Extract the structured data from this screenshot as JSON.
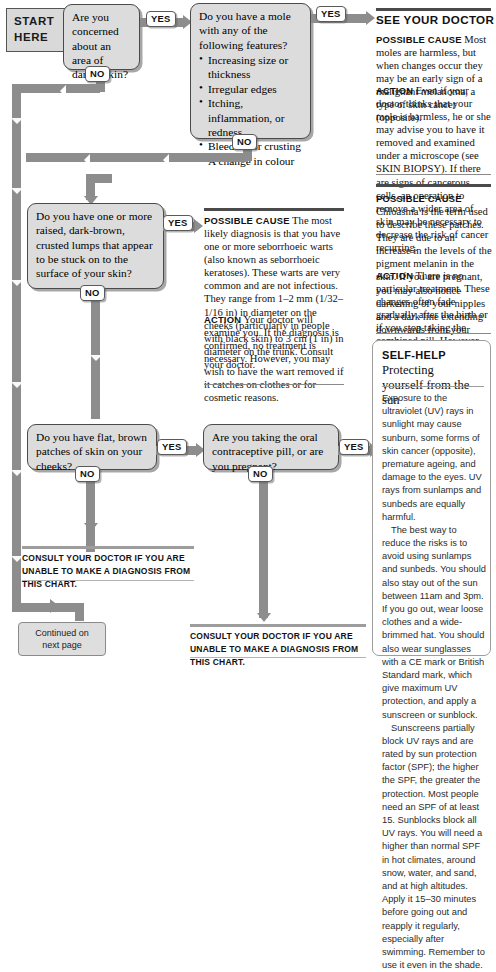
{
  "start_banner": {
    "line1": "START",
    "line2": "HERE"
  },
  "questions": [
    {
      "id": "q1",
      "text": "Are you concerned about an area of darker skin?"
    },
    {
      "id": "q2",
      "lead": "Do you have a mole with any of the following features?",
      "bullets": [
        "Increasing size or thickness",
        "Irregular edges",
        "Itching, inflammation, or redness",
        "Bleeding or crusting",
        "A change in colour"
      ]
    },
    {
      "id": "q3",
      "text": "Do you have one or more raised, dark-brown, crusted lumps that appear to be stuck on to the surface of your skin?"
    },
    {
      "id": "q4",
      "text": "Do you have flat, brown patches of skin on your cheeks?"
    },
    {
      "id": "q5",
      "text": "Are you taking the oral contraceptive pill, or are you pregnant?"
    }
  ],
  "pills": {
    "yes": "YES",
    "no": "NO"
  },
  "advice": [
    {
      "id": "see-your-doctor",
      "heading": "SEE YOUR DOCTOR",
      "possible_label": "POSSIBLE CAUSE",
      "possible_text": "Most moles are harmless, but when changes occur they may be an early sign of a malignant melanoma, a type of skin cancer (opposite).",
      "action_label": "ACTION",
      "action_text": "Even if your doctor thinks that your mole is harmless, he or she may advise you to have it removed and examined under a microscope (see SKIN BIOPSY). If there are signs of cancerous cells, an operation to remove a wider area of skin may be necessary to decrease the risk of cancer recurring."
    },
    {
      "id": "seborrhoeic-warts",
      "possible_label": "POSSIBLE CAUSE",
      "possible_text": "The most likely diagnosis is that you have one or more seborrhoeic warts (also known as seborrhoeic keratoses). These warts are very common and are not infectious. They range from 1–2 mm (1/32–1/16 in) in diameter on the cheeks (particularly in people with black skin) to 3 cm (1 in) in diameter on the trunk. Consult your doctor.",
      "action_label": "ACTION",
      "action_text": "Your doctor will examine you. If the diagnosis is confirmed, no treatment is necessary. However, you may wish to have the wart removed if it catches on clothes or for cosmetic reasons."
    },
    {
      "id": "chloasma",
      "possible_label": "POSSIBLE CAUSE",
      "possible_text": "Chloasma is the term used to describe these patches. They are due to an increase in the levels of the pigment melanin in the skin. If you are pregnant, you may also notice darkening of your nipples and a dark line extending downwards from your navel.",
      "action_label": "ACTION",
      "action_text": "There is no particular treatment. These changes often fade gradually after the birth or if you stop taking the combined pill. However, they do not always disappear completely."
    }
  ],
  "consult_notes": [
    {
      "id": "consult-left",
      "text": "CONSULT YOUR DOCTOR IF YOU ARE UNABLE TO MAKE A DIAGNOSIS FROM THIS CHART."
    },
    {
      "id": "consult-right",
      "text": "CONSULT YOUR DOCTOR IF YOU ARE UNABLE TO MAKE A DIAGNOSIS FROM THIS CHART."
    }
  ],
  "continued": {
    "line1": "Continued on",
    "line2": "next page"
  },
  "self_help": {
    "kicker": "SELF-HELP",
    "title_rest": "Protecting",
    "title_line2": "yourself from the sun",
    "paragraphs": [
      "Exposure to the ultraviolet (UV) rays in sunlight may cause sunburn, some forms of skin cancer (opposite), premature ageing, and damage to the eyes. UV rays from sunlamps and sunbeds are equally harmful.",
      "The best way to reduce the risks is to avoid using sunlamps and sunbeds. You should also stay out of the sun between 11am and 3pm. If you go out, wear loose clothes and a wide-brimmed hat. You should also wear sunglasses with a CE mark or British Standard mark, which give maximum UV protection, and apply a sunscreen or sunblock.",
      "Sunscreens partially block UV rays and are rated by sun protection factor (SPF); the higher the SPF, the greater the protection. Most people need an SPF of at least 15. Sunblocks block all UV rays. You will need a higher than normal SPF in hot climates, around snow, water, and sand, and at high altitudes. Apply it 15–30 minutes before going out and reapply it regularly, especially after swimming. Remember to use it even in the shade."
    ]
  },
  "colors": {
    "pipe": "#8d8d8d",
    "box_fill": "#dcdcdc",
    "box_border": "#4a4a4a",
    "rule": "#4a4a4a",
    "bar": "#9d9d9d"
  }
}
